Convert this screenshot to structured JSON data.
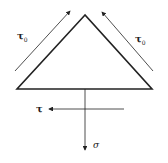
{
  "diagram": {
    "title": "",
    "shape": "triangle",
    "labels": {
      "tau0_left": "τ",
      "tau0_left_sub": "0",
      "tau0_right": "τ",
      "tau0_right_sub": "0",
      "tau": "τ",
      "sigma": "σ"
    },
    "colors": {
      "stroke": "#222222",
      "background": "#ffffff"
    }
  }
}
